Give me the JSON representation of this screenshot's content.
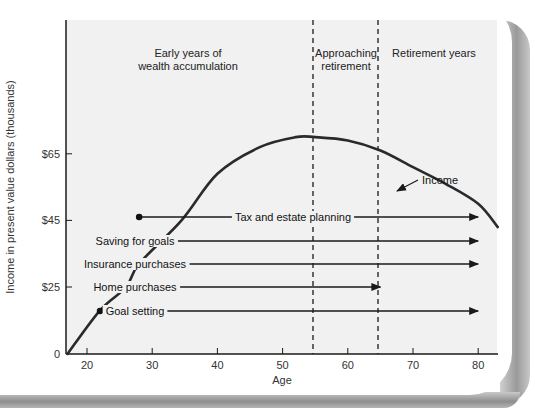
{
  "chart_data": {
    "type": "line",
    "title": "",
    "xlabel": "Age",
    "ylabel": "Income in present value dollars (thousands)",
    "xlim": [
      17,
      83
    ],
    "x_ticks": [
      20,
      30,
      40,
      50,
      60,
      70,
      80
    ],
    "y_ticks": [
      {
        "label": "0",
        "value": 5
      },
      {
        "label": "$25",
        "value": 25
      },
      {
        "label": "$45",
        "value": 45
      },
      {
        "label": "$65",
        "value": 65
      }
    ],
    "grid": false,
    "series": [
      {
        "name": "Income",
        "x": [
          17,
          22,
          26,
          28,
          34.5,
          40,
          46.5,
          52,
          55,
          60,
          65,
          70,
          75,
          80,
          83
        ],
        "values": [
          5,
          18,
          25,
          32,
          45,
          59,
          67,
          70,
          70,
          69,
          66,
          61,
          56,
          50,
          43
        ]
      }
    ],
    "regions": [
      {
        "label": "Early years of\nwealth accumulation",
        "line1": "Early years of",
        "line2": "wealth accumulation",
        "from": 17,
        "to": 55
      },
      {
        "label": "Approaching\nretirement",
        "line1": "Approaching",
        "line2": "retirement",
        "from": 55,
        "to": 65
      },
      {
        "label": "Retirement years",
        "line1": "Retirement years",
        "line2": "",
        "from": 65,
        "to": 83
      }
    ],
    "dividers": [
      55,
      65
    ],
    "annotations": [
      {
        "label": "Income",
        "pointer_age": 67.5
      },
      {
        "label": "Tax and estate planning",
        "start_age": 28,
        "end_age": 80,
        "level": 47
      },
      {
        "label": "Saving for goals",
        "start_age": 22,
        "end_age": 80,
        "level": 40
      },
      {
        "label": "Insurance purchases",
        "start_age": 22,
        "end_age": 80,
        "level": 33
      },
      {
        "label": "Home purchases",
        "start_age": 26,
        "end_age": 65,
        "level": 25
      },
      {
        "label": "Goal setting",
        "start_age": 22,
        "end_age": 80,
        "level": 18
      }
    ]
  },
  "colors": {
    "plot_bg": "#f1f1f1",
    "line": "#2a2a2a",
    "text": "#222222"
  }
}
